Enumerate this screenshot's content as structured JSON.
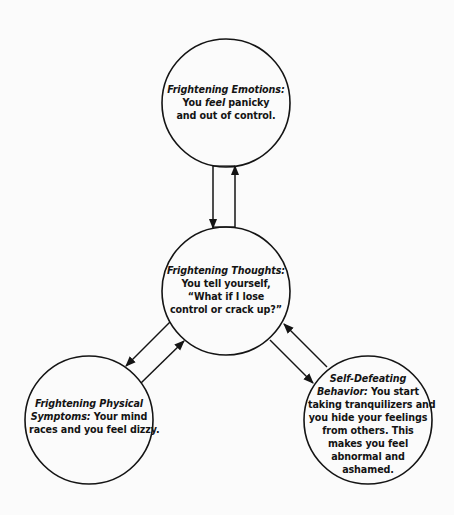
{
  "diagram": {
    "type": "cycle-diagram",
    "colors": {
      "background": "#fbfbfb",
      "stroke": "#141414",
      "text": "#141414"
    },
    "nodes": {
      "emotions": {
        "title": "Frightening Emotions:",
        "line1_pre": "You ",
        "line1_em": "feel",
        "line1_post": " panicky",
        "line2": "and out of control."
      },
      "thoughts": {
        "title": "Frightening Thoughts:",
        "line1": "You tell yourself,",
        "line2": "“What if I lose",
        "line3": "control or crack up?”"
      },
      "physical": {
        "title_line1": "Frightening Physical",
        "title_line2": "Symptoms:",
        "line2_rest": " Your mind",
        "line3": "races and you feel dizzy."
      },
      "behavior": {
        "title_line1": "Self-Defeating",
        "title_line2": "Behavior:",
        "line2_rest": " You start",
        "line3": "taking tranquilizers and",
        "line4": "you hide your feelings",
        "line5": "from others. This",
        "line6": "makes you feel",
        "line7": "abnormal and",
        "line8": "ashamed."
      }
    },
    "edges": [
      {
        "from": "emotions",
        "to": "thoughts"
      },
      {
        "from": "thoughts",
        "to": "emotions"
      },
      {
        "from": "thoughts",
        "to": "physical"
      },
      {
        "from": "physical",
        "to": "thoughts"
      },
      {
        "from": "thoughts",
        "to": "behavior"
      },
      {
        "from": "behavior",
        "to": "thoughts"
      }
    ]
  }
}
